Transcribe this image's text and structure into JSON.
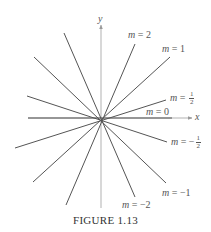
{
  "figure": {
    "caption": "FIGURE 1.13",
    "axis_labels": {
      "x": "x",
      "y": "y"
    },
    "origin_px": [
      101,
      118
    ],
    "line_color": "#555555",
    "axis_color": "#9a9a9a",
    "lines": [
      {
        "slope": "2",
        "label": "m = 2",
        "p1": [
          135,
          44
        ],
        "p2": [
          66,
          205
        ]
      },
      {
        "slope": "1",
        "label": "m = 1",
        "p1": [
          170,
          57
        ],
        "p2": [
          33,
          182
        ]
      },
      {
        "slope": "1/2",
        "label": "m = 1/2",
        "p1": [
          166,
          100
        ],
        "p2": [
          15,
          148
        ]
      },
      {
        "slope": "0",
        "label": "m = 0",
        "p1": [
          172,
          118
        ],
        "p2": [
          28,
          118
        ]
      },
      {
        "slope": "-1/2",
        "label": "m = -1/2",
        "p1": [
          167,
          142
        ],
        "p2": [
          27,
          96
        ]
      },
      {
        "slope": "-1",
        "label": "m = -1",
        "p1": [
          166,
          183
        ],
        "p2": [
          34,
          57
        ]
      },
      {
        "slope": "-2",
        "label": "m = -2",
        "p1": [
          135,
          197
        ],
        "p2": [
          64,
          33
        ]
      }
    ],
    "labels": {
      "m2": {
        "var": "m",
        "eq": " = ",
        "val": "2"
      },
      "m1": {
        "var": "m",
        "eq": " = ",
        "val": "1"
      },
      "mhalf": {
        "var": "m",
        "eq": " = ",
        "num": "1",
        "den": "2"
      },
      "m0": {
        "var": "m",
        "eq": " = ",
        "val": "0"
      },
      "mneghalf": {
        "var": "m",
        "eq": " = −",
        "num": "1",
        "den": "2"
      },
      "mneg1": {
        "var": "m",
        "eq": " = ",
        "val": "−1"
      },
      "mneg2": {
        "var": "m",
        "eq": " = ",
        "val": "−2"
      }
    }
  }
}
